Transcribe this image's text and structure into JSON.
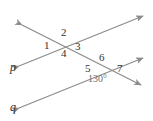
{
  "figure": {
    "background_color": "#ffffff",
    "line_color": "#8c8c8c",
    "text_color": "#333333",
    "angle_text_color": "#6e6e6e",
    "line_labels": [
      {
        "id": "p",
        "text": "p",
        "x": 10,
        "y": 61
      },
      {
        "id": "q",
        "text": "q",
        "x": 10,
        "y": 101
      }
    ],
    "angle_numbers": [
      {
        "id": "angle-1",
        "text": "1",
        "x": 44,
        "y": 40
      },
      {
        "id": "angle-2",
        "text": "2",
        "x": 61,
        "y": 27
      },
      {
        "id": "angle-3",
        "text": "3",
        "x": 75,
        "y": 41
      },
      {
        "id": "angle-4",
        "text": "4",
        "x": 61,
        "y": 48
      },
      {
        "id": "angle-5",
        "text": "5",
        "x": 85,
        "y": 63
      },
      {
        "id": "angle-6",
        "text": "6",
        "x": 99,
        "y": 52
      },
      {
        "id": "angle-7",
        "text": "7",
        "x": 117,
        "y": 63
      }
    ],
    "angle_measures": [
      {
        "id": "angle-130",
        "text": "130°",
        "x": 88,
        "y": 74
      }
    ],
    "lines": [
      {
        "id": "line-p",
        "label": "p",
        "description": "lower-left to upper-right ray with arrowheads on both ends",
        "x1": 19,
        "y1": 66,
        "x2": 143,
        "y2": 16
      },
      {
        "id": "line-q",
        "label": "q",
        "description": "lower-left to upper-right ray with arrowheads on both ends",
        "x1": 19,
        "y1": 108,
        "x2": 143,
        "y2": 58
      },
      {
        "id": "line-transversal",
        "label": "",
        "description": "steep line from upper-left down to lower-right crossing both p and q",
        "x1": 22,
        "y1": 25,
        "x2": 141,
        "y2": 85
      }
    ],
    "intersections": [
      {
        "id": "intersection-p",
        "x": 67,
        "y": 42
      },
      {
        "id": "intersection-q",
        "x": 104,
        "y": 64
      }
    ]
  }
}
